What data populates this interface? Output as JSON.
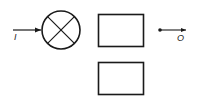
{
  "diagram": {
    "input_label": "I",
    "output_label": "O",
    "elements": [
      {
        "id": "input-arrow",
        "type": "arrow"
      },
      {
        "id": "multiplier",
        "type": "circle-cross"
      },
      {
        "id": "block-top",
        "type": "rect"
      },
      {
        "id": "block-bottom",
        "type": "rect"
      },
      {
        "id": "output-terminal",
        "type": "dot-arrow"
      }
    ],
    "stroke_color": "#1a1a1a",
    "background": "#ffffff"
  }
}
